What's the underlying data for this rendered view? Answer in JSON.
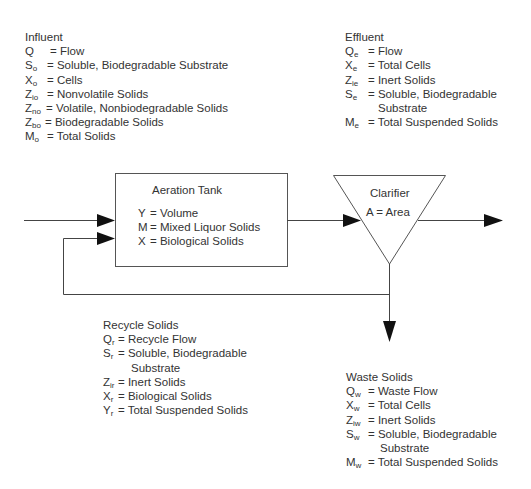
{
  "influent": {
    "title": "Influent",
    "items": [
      {
        "sym": "Q",
        "sub": "",
        "def": "= Flow"
      },
      {
        "sym": "S",
        "sub": "o",
        "def": "= Soluble, Biodegradable Substrate"
      },
      {
        "sym": "X",
        "sub": "o",
        "def": "= Cells"
      },
      {
        "sym": "Z",
        "sub": "io",
        "def": "= Nonvolatile Solids"
      },
      {
        "sym": "Z",
        "sub": "no",
        "def": "= Volatile, Nonbiodegradable Solids"
      },
      {
        "sym": "Z",
        "sub": "bo",
        "def": "= Biodegradable Solids"
      },
      {
        "sym": "M",
        "sub": "o",
        "def": "= Total Solids"
      }
    ]
  },
  "effluent": {
    "title": "Effluent",
    "items": [
      {
        "sym": "Q",
        "sub": "e",
        "def": "= Flow"
      },
      {
        "sym": "X",
        "sub": "e",
        "def": "= Total Cells"
      },
      {
        "sym": "Z",
        "sub": "ie",
        "def": "= Inert Solids"
      },
      {
        "sym": "S",
        "sub": "e",
        "def": "= Soluble, Biodegradable",
        "cont": "Substrate"
      },
      {
        "sym": "M",
        "sub": "e",
        "def": "= Total Suspended Solids"
      }
    ]
  },
  "aeration_tank": {
    "title": "Aeration Tank",
    "items": [
      {
        "sym": "Y",
        "def": "= Volume"
      },
      {
        "sym": "M",
        "def": "= Mixed Liquor Solids"
      },
      {
        "sym": "X",
        "def": "= Biological Solids"
      }
    ]
  },
  "clarifier": {
    "title": "Clarifier",
    "items": [
      {
        "sym": "A",
        "def": "= Area"
      }
    ]
  },
  "recycle": {
    "title": "Recycle Solids",
    "items": [
      {
        "sym": "Q",
        "sub": "r",
        "def": "= Recycle Flow"
      },
      {
        "sym": "S",
        "sub": "r",
        "def": "= Soluble, Biodegradable",
        "cont": "Substrate"
      },
      {
        "sym": "Z",
        "sub": "ir",
        "def": "= Inert Solids"
      },
      {
        "sym": "X",
        "sub": "r",
        "def": "= Biological Solids"
      },
      {
        "sym": "Y",
        "sub": "r",
        "def": "= Total Suspended Solids"
      }
    ]
  },
  "waste": {
    "title": "Waste Solids",
    "items": [
      {
        "sym": "Q",
        "sub": "w",
        "def": "= Waste Flow"
      },
      {
        "sym": "X",
        "sub": "w",
        "def": "= Total Cells"
      },
      {
        "sym": "Z",
        "sub": "iw",
        "def": "= Inert Solids"
      },
      {
        "sym": "S",
        "sub": "w",
        "def": "= Soluble, Biodegradable",
        "cont": "Substrate"
      },
      {
        "sym": "M",
        "sub": "w",
        "def": "= Total Suspended Solids"
      }
    ]
  },
  "colors": {
    "line": "#3a3a3a",
    "text": "#333333",
    "background": "#ffffff"
  }
}
